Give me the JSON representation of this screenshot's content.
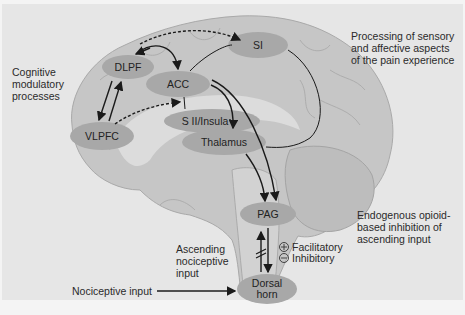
{
  "diagram": {
    "colors": {
      "background": "#e6e6e6",
      "brain": "#c8c8c8",
      "brain_shadow": "#b4b4b4",
      "node": "#a6a6a6",
      "text": "#2a2a2a",
      "arrow": "#1a1a1a"
    },
    "nodes": {
      "dlpf": "DLPF",
      "acc": "ACC",
      "si": "SI",
      "sii_insula": "S II/Insula",
      "thalamus": "Thalamus",
      "vlpfc": "VLPFC",
      "pag": "PAG",
      "dorsal_horn": "Dorsal\nhorn"
    },
    "annotations": {
      "cognitive": "Cognitive\nmodulatory\nprocesses",
      "processing": "Processing of sensory\nand affective aspects\nof the pain experience",
      "endogenous": "Endogenous opioid-\nbased inhibition of\nascending input",
      "ascending": "Ascending\nnociceptive\ninput",
      "nociceptive_input": "Nociceptive input"
    },
    "legend": {
      "facilitatory_symbol": "+",
      "facilitatory": "Facilitatory",
      "inhibitory_symbol": "−",
      "inhibitory": "Inhibitory"
    }
  }
}
